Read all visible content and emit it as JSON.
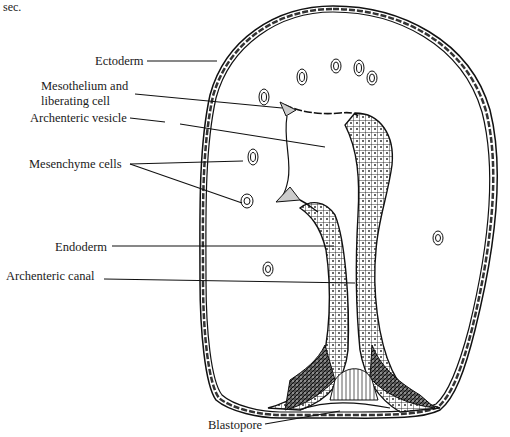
{
  "caption": "sec.",
  "diagram": {
    "type": "embryo-section",
    "labels": [
      {
        "id": "ectoderm",
        "text": "Ectoderm",
        "x": 95,
        "y": 52
      },
      {
        "id": "mesothelium",
        "text": "Mesothelium and",
        "x": 41,
        "y": 79
      },
      {
        "id": "mesothelium2",
        "text": "liberating cell",
        "x": 41,
        "y": 94
      },
      {
        "id": "archenteric-vesicle",
        "text": "Archenteric vesicle",
        "x": 30,
        "y": 110
      },
      {
        "id": "mesenchyme",
        "text": "Mesenchyme cells",
        "x": 29,
        "y": 157
      },
      {
        "id": "endoderm",
        "text": "Endoderm",
        "x": 55,
        "y": 240
      },
      {
        "id": "archenteric-canal",
        "text": "Archenteric canal",
        "x": 6,
        "y": 269
      },
      {
        "id": "blastopore",
        "text": "Blastopore",
        "x": 208,
        "y": 425
      }
    ]
  }
}
